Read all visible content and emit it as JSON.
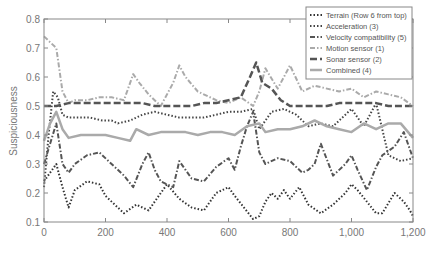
{
  "chart_data": {
    "type": "line",
    "title": "",
    "xlabel": "",
    "ylabel": "Suspiciousness",
    "xlim": [
      0,
      1200
    ],
    "ylim": [
      0.1,
      0.8
    ],
    "xticks": [
      0,
      200,
      400,
      600,
      800,
      1000,
      1200
    ],
    "xtick_labels": [
      "0",
      "200",
      "400",
      "600",
      "800",
      "1,000",
      "1,200"
    ],
    "yticks": [
      0.1,
      0.2,
      0.3,
      0.4,
      0.5,
      0.6,
      0.7,
      0.8
    ],
    "ytick_labels": [
      "0.1",
      "0.2",
      "0.3",
      "0.4",
      "0.5",
      "0.6",
      "0.7",
      "0.8"
    ],
    "grid": false,
    "legend_position": "upper right",
    "series": [
      {
        "name": "Terrain (Row 6 from top)",
        "style": "dotted",
        "color": "#333333",
        "width": 2,
        "x": [
          0,
          20,
          40,
          60,
          80,
          100,
          140,
          180,
          200,
          240,
          260,
          300,
          340,
          380,
          400,
          440,
          480,
          520,
          560,
          600,
          620,
          650,
          680,
          700,
          720,
          740,
          760,
          780,
          800,
          830,
          860,
          900,
          940,
          980,
          1000,
          1020,
          1050,
          1080,
          1100,
          1140,
          1170,
          1190,
          1200
        ],
        "y": [
          0.24,
          0.27,
          0.3,
          0.22,
          0.15,
          0.21,
          0.24,
          0.23,
          0.19,
          0.15,
          0.13,
          0.16,
          0.14,
          0.2,
          0.23,
          0.18,
          0.15,
          0.14,
          0.2,
          0.22,
          0.19,
          0.15,
          0.11,
          0.12,
          0.17,
          0.2,
          0.18,
          0.21,
          0.18,
          0.22,
          0.16,
          0.13,
          0.16,
          0.2,
          0.23,
          0.21,
          0.17,
          0.13,
          0.13,
          0.2,
          0.17,
          0.14,
          0.12
        ]
      },
      {
        "name": "Acceleration (3)",
        "style": "dotted",
        "color": "#444444",
        "width": 2,
        "x": [
          0,
          15,
          30,
          45,
          60,
          80,
          110,
          150,
          190,
          220,
          240,
          280,
          320,
          360,
          400,
          440,
          480,
          520,
          560,
          600,
          640,
          680,
          700,
          740,
          780,
          820,
          860,
          900,
          940,
          980,
          1000,
          1040,
          1080,
          1120,
          1160,
          1200
        ],
        "y": [
          0.22,
          0.4,
          0.55,
          0.53,
          0.47,
          0.46,
          0.46,
          0.46,
          0.45,
          0.45,
          0.44,
          0.45,
          0.47,
          0.48,
          0.47,
          0.46,
          0.46,
          0.46,
          0.47,
          0.48,
          0.48,
          0.49,
          0.42,
          0.48,
          0.49,
          0.47,
          0.43,
          0.44,
          0.43,
          0.47,
          0.49,
          0.43,
          0.51,
          0.33,
          0.31,
          0.32
        ]
      },
      {
        "name": "Velocity compatibility (5)",
        "style": "dashdot",
        "color": "#555555",
        "width": 2,
        "x": [
          0,
          20,
          40,
          60,
          80,
          100,
          140,
          180,
          220,
          260,
          290,
          320,
          340,
          360,
          380,
          420,
          440,
          460,
          480,
          520,
          560,
          600,
          620,
          640,
          660,
          680,
          700,
          720,
          760,
          800,
          840,
          860,
          880,
          900,
          940,
          980,
          1000,
          1020,
          1050,
          1080,
          1100,
          1140,
          1170,
          1200
        ],
        "y": [
          0.3,
          0.37,
          0.44,
          0.3,
          0.27,
          0.3,
          0.33,
          0.34,
          0.3,
          0.26,
          0.22,
          0.3,
          0.34,
          0.28,
          0.24,
          0.22,
          0.31,
          0.28,
          0.25,
          0.24,
          0.29,
          0.32,
          0.28,
          0.36,
          0.43,
          0.48,
          0.34,
          0.3,
          0.32,
          0.31,
          0.27,
          0.28,
          0.3,
          0.37,
          0.26,
          0.3,
          0.33,
          0.28,
          0.21,
          0.29,
          0.33,
          0.36,
          0.41,
          0.32
        ]
      },
      {
        "name": "Motion sensor (1)",
        "style": "dashdot",
        "color": "#aaaaaa",
        "width": 2,
        "x": [
          0,
          20,
          40,
          60,
          80,
          100,
          140,
          180,
          220,
          260,
          290,
          310,
          340,
          380,
          420,
          440,
          460,
          500,
          560,
          600,
          640,
          680,
          700,
          720,
          760,
          780,
          800,
          840,
          880,
          920,
          960,
          1000,
          1040,
          1080,
          1120,
          1160,
          1200
        ],
        "y": [
          0.74,
          0.72,
          0.7,
          0.55,
          0.51,
          0.52,
          0.52,
          0.53,
          0.53,
          0.52,
          0.61,
          0.58,
          0.54,
          0.5,
          0.58,
          0.64,
          0.6,
          0.55,
          0.52,
          0.51,
          0.53,
          0.5,
          0.55,
          0.63,
          0.56,
          0.6,
          0.64,
          0.55,
          0.57,
          0.56,
          0.55,
          0.56,
          0.53,
          0.55,
          0.54,
          0.53,
          0.5
        ]
      },
      {
        "name": "Sonar sensor (2)",
        "style": "dashed",
        "color": "#555555",
        "width": 2.5,
        "x": [
          0,
          40,
          80,
          120,
          160,
          200,
          240,
          280,
          320,
          360,
          400,
          440,
          480,
          520,
          560,
          600,
          640,
          670,
          690,
          710,
          740,
          770,
          800,
          840,
          880,
          920,
          960,
          1000,
          1040,
          1080,
          1120,
          1160,
          1200
        ],
        "y": [
          0.5,
          0.5,
          0.51,
          0.51,
          0.51,
          0.51,
          0.51,
          0.51,
          0.51,
          0.5,
          0.5,
          0.5,
          0.5,
          0.51,
          0.51,
          0.52,
          0.53,
          0.6,
          0.65,
          0.58,
          0.56,
          0.52,
          0.5,
          0.5,
          0.5,
          0.5,
          0.51,
          0.51,
          0.51,
          0.51,
          0.5,
          0.5,
          0.5
        ]
      },
      {
        "name": "Combined (4)",
        "style": "solid",
        "color": "#aaaaaa",
        "width": 2.5,
        "x": [
          0,
          20,
          40,
          60,
          80,
          120,
          160,
          200,
          240,
          280,
          300,
          340,
          380,
          420,
          460,
          500,
          540,
          580,
          620,
          660,
          700,
          720,
          760,
          800,
          840,
          880,
          920,
          960,
          1000,
          1040,
          1080,
          1120,
          1160,
          1200
        ],
        "y": [
          0.38,
          0.44,
          0.48,
          0.42,
          0.39,
          0.4,
          0.4,
          0.4,
          0.39,
          0.38,
          0.42,
          0.4,
          0.41,
          0.41,
          0.41,
          0.4,
          0.41,
          0.41,
          0.4,
          0.43,
          0.44,
          0.41,
          0.42,
          0.42,
          0.43,
          0.45,
          0.43,
          0.42,
          0.41,
          0.44,
          0.42,
          0.44,
          0.44,
          0.39
        ]
      }
    ]
  }
}
